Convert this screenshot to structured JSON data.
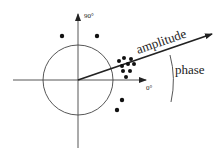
{
  "diagram": {
    "labels": {
      "y_axis": "90°",
      "x_axis": "0°",
      "vector": "amplitude",
      "angle": "phase"
    },
    "colors": {
      "ink": "#222222",
      "background": "#ffffff"
    },
    "circle": {
      "cx": 78,
      "cy": 80,
      "r": 35
    },
    "vector_end": {
      "x": 212,
      "y": 34
    },
    "dots": [
      {
        "x": 62,
        "y": 36
      },
      {
        "x": 97,
        "y": 36
      },
      {
        "x": 119,
        "y": 61
      },
      {
        "x": 124,
        "y": 58
      },
      {
        "x": 131,
        "y": 59
      },
      {
        "x": 122,
        "y": 66
      },
      {
        "x": 128,
        "y": 64
      },
      {
        "x": 134,
        "y": 64
      },
      {
        "x": 123,
        "y": 71
      },
      {
        "x": 130,
        "y": 71
      },
      {
        "x": 126,
        "y": 77
      },
      {
        "x": 122,
        "y": 100
      },
      {
        "x": 117,
        "y": 110
      }
    ]
  }
}
